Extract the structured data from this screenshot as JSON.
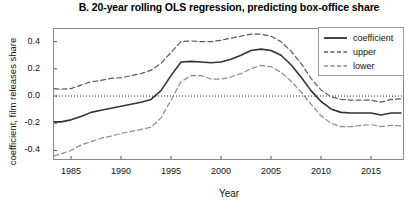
{
  "chart_data": {
    "type": "line",
    "title": "B. 20-year rolling OLS regression, predicting box-office share",
    "xlabel": "Year",
    "ylabel": "coefficient, film releases share",
    "xlim": [
      1983.2,
      2018.3
    ],
    "ylim": [
      -0.47,
      0.5
    ],
    "xticks": [
      1985,
      1990,
      1995,
      2000,
      2005,
      2010,
      2015
    ],
    "xticklabels": [
      "1985",
      "1990",
      "1995",
      "2000",
      "2005",
      "2010",
      "2015"
    ],
    "yticks": [
      0.4,
      0.2,
      0.0,
      -0.2,
      -0.4
    ],
    "yticklabels": [
      "0.4",
      "0.2",
      "0.0",
      "-0.2",
      "-0.4"
    ],
    "grid": false,
    "zero_reference_line": 0.0,
    "legend_position": "top-right",
    "x": [
      1983.3,
      1984,
      1985,
      1986,
      1987,
      1988,
      1989,
      1990,
      1991,
      1992,
      1993,
      1994,
      1995,
      1996,
      1997,
      1998,
      1999,
      2000,
      2001,
      2002,
      2003,
      2004,
      2005,
      2006,
      2007,
      2008,
      2009,
      2010,
      2011,
      2012,
      2013,
      2014,
      2015,
      2016,
      2017,
      2018
    ],
    "series": [
      {
        "name": "coefficient",
        "style": "solid",
        "color": "#333333",
        "values": [
          -0.19,
          -0.19,
          -0.175,
          -0.15,
          -0.12,
          -0.105,
          -0.09,
          -0.075,
          -0.06,
          -0.045,
          -0.025,
          0.04,
          0.15,
          0.25,
          0.255,
          0.25,
          0.245,
          0.25,
          0.27,
          0.3,
          0.335,
          0.345,
          0.335,
          0.3,
          0.23,
          0.14,
          0.04,
          -0.04,
          -0.095,
          -0.12,
          -0.125,
          -0.125,
          -0.125,
          -0.14,
          -0.125,
          -0.125
        ]
      },
      {
        "name": "upper",
        "style": "dashed",
        "color": "#5a5a5a",
        "values": [
          0.055,
          0.05,
          0.055,
          0.08,
          0.105,
          0.115,
          0.13,
          0.135,
          0.15,
          0.165,
          0.19,
          0.24,
          0.32,
          0.4,
          0.405,
          0.4,
          0.4,
          0.41,
          0.425,
          0.44,
          0.455,
          0.455,
          0.44,
          0.4,
          0.33,
          0.24,
          0.13,
          0.045,
          -0.005,
          -0.025,
          -0.03,
          -0.03,
          -0.03,
          -0.045,
          -0.025,
          -0.02
        ]
      },
      {
        "name": "lower",
        "style": "dashed",
        "color": "#8a8a8a",
        "values": [
          -0.44,
          -0.425,
          -0.4,
          -0.36,
          -0.335,
          -0.31,
          -0.295,
          -0.275,
          -0.26,
          -0.245,
          -0.23,
          -0.16,
          -0.03,
          0.105,
          0.15,
          0.15,
          0.125,
          0.125,
          0.14,
          0.165,
          0.2,
          0.225,
          0.215,
          0.175,
          0.11,
          0.03,
          -0.06,
          -0.145,
          -0.2,
          -0.225,
          -0.225,
          -0.215,
          -0.21,
          -0.225,
          -0.215,
          -0.22
        ]
      }
    ],
    "legend": [
      {
        "label": "coefficient",
        "style": "solid"
      },
      {
        "label": "upper",
        "style": "dashed"
      },
      {
        "label": "lower",
        "style": "dashed"
      }
    ]
  }
}
